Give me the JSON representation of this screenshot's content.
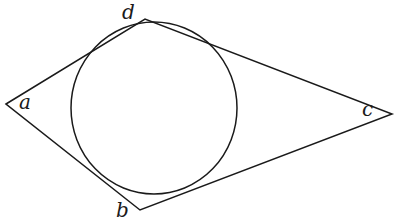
{
  "figure": {
    "stroke_color": "#1a1a1a",
    "background": "#ffffff",
    "vertices": {
      "a": {
        "label": "a",
        "x": 6,
        "y": 104
      },
      "d": {
        "label": "d",
        "x": 145,
        "y": 19
      },
      "c": {
        "label": "c",
        "x": 392,
        "y": 114
      },
      "b": {
        "label": "b",
        "x": 140,
        "y": 210
      }
    },
    "polygon_order": [
      "a",
      "d",
      "c",
      "b"
    ],
    "incircle": {
      "cx": 154,
      "cy": 108,
      "rx": 83,
      "ry": 86
    }
  }
}
